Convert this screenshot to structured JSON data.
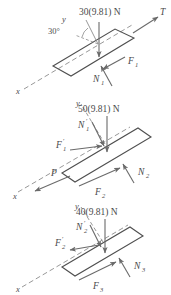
{
  "figure": {
    "type": "free-body-diagram",
    "stroke_color": "#4f4f4f",
    "label_color": "#4a4a4a",
    "background": "#ffffff",
    "incline_angle_deg": 30
  },
  "diagrams": [
    {
      "id": "top-block",
      "weight_label": "30(9.81) N",
      "angle_label": "30°",
      "axis_x_label": "x",
      "axis_y_label": "y",
      "forces": [
        {
          "name": "tension",
          "label": "T"
        },
        {
          "name": "friction-1",
          "label": "F",
          "sub": "1"
        },
        {
          "name": "normal-1",
          "label": "N",
          "sub": "1"
        }
      ]
    },
    {
      "id": "middle-block",
      "weight_label": "50(9.81) N",
      "axis_x_label": "x",
      "axis_y_label": "y",
      "forces": [
        {
          "name": "normal-1-reaction",
          "label": "N",
          "sub": "1",
          "prime": true
        },
        {
          "name": "friction-1-reaction",
          "label": "F",
          "sub": "1",
          "prime": true
        },
        {
          "name": "applied-force",
          "label": "P"
        },
        {
          "name": "friction-2",
          "label": "F",
          "sub": "2"
        },
        {
          "name": "normal-2",
          "label": "N",
          "sub": "2"
        }
      ]
    },
    {
      "id": "bottom-block",
      "weight_label": "40(9.81) N",
      "axis_x_label": "x",
      "axis_y_label": "y",
      "forces": [
        {
          "name": "normal-2-reaction",
          "label": "N",
          "sub": "2",
          "prime": true
        },
        {
          "name": "friction-2-reaction",
          "label": "F",
          "sub": "2",
          "prime": true
        },
        {
          "name": "friction-3",
          "label": "F",
          "sub": "3"
        },
        {
          "name": "normal-3",
          "label": "N",
          "sub": "3"
        }
      ]
    }
  ],
  "text": {
    "d1_weight": "30(9.81) N",
    "d1_angle": "30°",
    "d1_T": "T",
    "d1_F1": "F",
    "d1_F1_sub": "1",
    "d1_N1": "N",
    "d1_N1_sub": "1",
    "d1_x": "x",
    "d1_y": "y",
    "d2_weight": "50(9.81) N",
    "d2_N1p": "N",
    "d2_N1p_sub": "1",
    "d2_F1p": "F",
    "d2_F1p_sub": "1",
    "d2_P": "P",
    "d2_F2": "F",
    "d2_F2_sub": "2",
    "d2_N2": "N",
    "d2_N2_sub": "2",
    "d2_x": "x",
    "d2_y": "y",
    "d3_weight": "40(9.81) N",
    "d3_N2p": "N",
    "d3_N2p_sub": "2",
    "d3_F2p": "F",
    "d3_F2p_sub": "2",
    "d3_F3": "F",
    "d3_F3_sub": "3",
    "d3_N3": "N",
    "d3_N3_sub": "3",
    "d3_x": "x",
    "d3_y": "y",
    "prime": "′"
  }
}
